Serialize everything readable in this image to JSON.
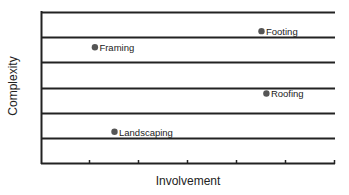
{
  "chart_data": {
    "type": "scatter",
    "title": "",
    "xlabel": "Involvement",
    "ylabel": "Complexity",
    "xlim": [
      0,
      6
    ],
    "ylim": [
      0,
      6
    ],
    "grid": {
      "horizontal": true,
      "vertical": false
    },
    "x_ticks": [
      0,
      1,
      2,
      3,
      4,
      5,
      6
    ],
    "y_gridlines": [
      1,
      2,
      3,
      4,
      5,
      6
    ],
    "tick_labels_shown": false,
    "legend": null,
    "marker_color": "#555555",
    "points": [
      {
        "label": "Framing",
        "x": 1.1,
        "y": 4.6
      },
      {
        "label": "Footing",
        "x": 4.5,
        "y": 5.24
      },
      {
        "label": "Roofing",
        "x": 4.6,
        "y": 2.76
      },
      {
        "label": "Landscaping",
        "x": 1.5,
        "y": 1.24
      }
    ]
  },
  "colors": {
    "axis": "#222222",
    "grid": "#222222",
    "marker": "#555555",
    "text": "#222222"
  }
}
